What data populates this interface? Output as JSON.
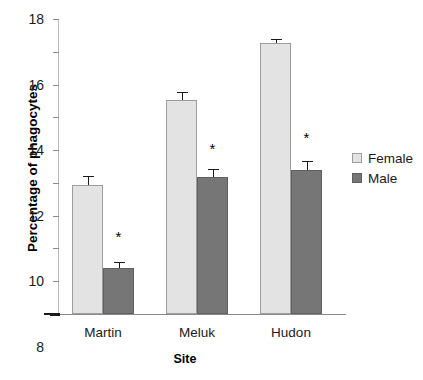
{
  "chart_data": {
    "type": "bar",
    "title": "",
    "xlabel": "Site",
    "ylabel": "Percentage of phagocytes",
    "categories": [
      "Martin",
      "Meluk",
      "Hudon"
    ],
    "series": [
      {
        "name": "Female",
        "color": "#e3e3e3",
        "values": [
          7.9,
          13.05,
          16.55
        ],
        "errors": [
          0.5,
          0.5,
          0.25
        ]
      },
      {
        "name": "Male",
        "color": "#767676",
        "values": [
          2.8,
          8.35,
          8.8
        ],
        "errors": [
          0.35,
          0.5,
          0.55
        ]
      }
    ],
    "ylim": [
      0,
      18
    ],
    "yticks": [
      0,
      2,
      4,
      6,
      8,
      10,
      12,
      14,
      16,
      18
    ],
    "ytick_labels": [
      "0",
      "2",
      "4",
      "6",
      "8",
      "10",
      "12",
      "14",
      "16",
      "18"
    ],
    "grid": false,
    "legend_position": "right",
    "annotations": [
      {
        "text": "*",
        "category": "Martin",
        "series": "Male",
        "y": 4.75
      },
      {
        "text": "*",
        "category": "Meluk",
        "series": "Male",
        "y": 10.1
      },
      {
        "text": "*",
        "category": "Hudon",
        "series": "Male",
        "y": 10.8
      }
    ]
  },
  "legend": {
    "items": [
      {
        "label": "Female"
      },
      {
        "label": "Male"
      }
    ]
  }
}
